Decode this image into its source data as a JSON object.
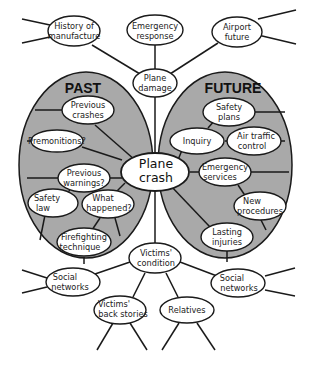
{
  "diagram": {
    "center": {
      "label_line1": "Plane",
      "label_line2": "crash"
    },
    "regions": {
      "past": {
        "label": "PAST",
        "color": "#a9a9a9"
      },
      "future": {
        "label": "FUTURE",
        "color": "#a9a9a9"
      }
    },
    "nodes": {
      "history": {
        "l1": "History of",
        "l2": "manufacture"
      },
      "emergency_response": {
        "l1": "Emergency",
        "l2": "response"
      },
      "airport_future": {
        "l1": "Airport",
        "l2": "future"
      },
      "plane_damage": {
        "l1": "Plane",
        "l2": "damage"
      },
      "previous_crashes": {
        "l1": "Previous",
        "l2": "crashes"
      },
      "premonitions": {
        "l1": "Premonitions?"
      },
      "previous_warnings": {
        "l1": "Previous",
        "l2": "warnings?"
      },
      "safety_law": {
        "l1": "Safety",
        "l2": "law"
      },
      "what_happened": {
        "l1": "What",
        "l2": "happened?"
      },
      "firefighting": {
        "l1": "Firefighting",
        "l2": "technique"
      },
      "safety_plans": {
        "l1": "Safety",
        "l2": "plans"
      },
      "inquiry": {
        "l1": "Inquiry"
      },
      "air_traffic": {
        "l1": "Air traffic",
        "l2": "control"
      },
      "emergency_services": {
        "l1": "Emergency",
        "l2": "services"
      },
      "new_procedures": {
        "l1": "New",
        "l2": "procedures"
      },
      "lasting_injuries": {
        "l1": "Lasting",
        "l2": "injuries"
      },
      "victims_condition": {
        "l1": "Victims'",
        "l2": "condition"
      },
      "social_left": {
        "l1": "Social",
        "l2": "networks"
      },
      "social_right": {
        "l1": "Social",
        "l2": "networks"
      },
      "victims_back": {
        "l1": "Victims'",
        "l2": "back stories"
      },
      "relatives": {
        "l1": "Relatives"
      }
    }
  }
}
